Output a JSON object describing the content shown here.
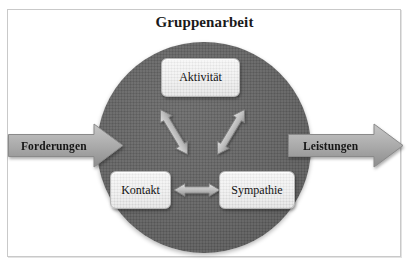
{
  "diagram": {
    "title": "Gruppenarbeit",
    "frame": {
      "name": "outer-frame"
    },
    "circle": {
      "name": "group-work-circle",
      "fill": "#636363"
    },
    "nodes": [
      {
        "id": "aktivitaet",
        "label": "Aktivität"
      },
      {
        "id": "kontakt",
        "label": "Kontakt"
      },
      {
        "id": "sympathie",
        "label": "Sympathie"
      }
    ],
    "flow_arrows": [
      {
        "id": "input",
        "label": "Forderungen",
        "direction": "right"
      },
      {
        "id": "output",
        "label": "Leistungen",
        "direction": "right"
      }
    ],
    "connectors": [
      {
        "id": "kontakt-aktivitaet",
        "from": "Kontakt",
        "to": "Aktivität",
        "style": "double-headed"
      },
      {
        "id": "aktivitaet-sympathie",
        "from": "Aktivität",
        "to": "Sympathie",
        "style": "double-headed"
      },
      {
        "id": "kontakt-sympathie",
        "from": "Kontakt",
        "to": "Sympathie",
        "style": "double-headed"
      }
    ],
    "colors": {
      "circle_fill": "#636363",
      "arrow_fill": "#a8a8a8",
      "node_fill": "#eaeaea",
      "text": "#121212",
      "frame_border": "#c9c9c9"
    }
  }
}
